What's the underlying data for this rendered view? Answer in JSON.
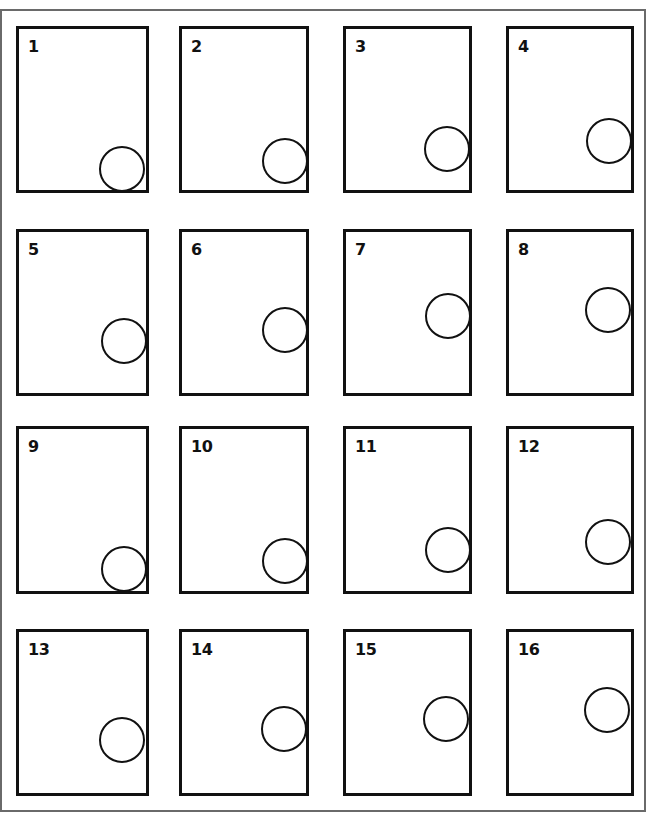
{
  "figure": {
    "grid": {
      "rows": 4,
      "columns": 4
    },
    "panels": [
      {
        "label": "1",
        "x": 16,
        "y": 26,
        "w": 133,
        "h": 167,
        "circle": {
          "cx": 122,
          "cy": 169,
          "r": 23
        }
      },
      {
        "label": "2",
        "x": 179,
        "y": 26,
        "w": 130,
        "h": 167,
        "circle": {
          "cx": 285,
          "cy": 161,
          "r": 23
        }
      },
      {
        "label": "3",
        "x": 343,
        "y": 26,
        "w": 129,
        "h": 167,
        "circle": {
          "cx": 447,
          "cy": 149,
          "r": 23
        }
      },
      {
        "label": "4",
        "x": 506,
        "y": 26,
        "w": 128,
        "h": 167,
        "circle": {
          "cx": 609,
          "cy": 141,
          "r": 23
        }
      },
      {
        "label": "5",
        "x": 16,
        "y": 229,
        "w": 133,
        "h": 167,
        "circle": {
          "cx": 124,
          "cy": 341,
          "r": 23
        }
      },
      {
        "label": "6",
        "x": 179,
        "y": 229,
        "w": 130,
        "h": 167,
        "circle": {
          "cx": 285,
          "cy": 330,
          "r": 23
        }
      },
      {
        "label": "7",
        "x": 343,
        "y": 229,
        "w": 129,
        "h": 167,
        "circle": {
          "cx": 448,
          "cy": 316,
          "r": 23
        }
      },
      {
        "label": "8",
        "x": 506,
        "y": 229,
        "w": 128,
        "h": 167,
        "circle": {
          "cx": 608,
          "cy": 310,
          "r": 23
        }
      },
      {
        "label": "9",
        "x": 16,
        "y": 426,
        "w": 133,
        "h": 168,
        "circle": {
          "cx": 124,
          "cy": 569,
          "r": 23
        }
      },
      {
        "label": "10",
        "x": 179,
        "y": 426,
        "w": 130,
        "h": 168,
        "circle": {
          "cx": 285,
          "cy": 561,
          "r": 23
        }
      },
      {
        "label": "11",
        "x": 343,
        "y": 426,
        "w": 129,
        "h": 168,
        "circle": {
          "cx": 448,
          "cy": 550,
          "r": 23
        }
      },
      {
        "label": "12",
        "x": 506,
        "y": 426,
        "w": 128,
        "h": 168,
        "circle": {
          "cx": 608,
          "cy": 542,
          "r": 23
        }
      },
      {
        "label": "13",
        "x": 16,
        "y": 629,
        "w": 133,
        "h": 167,
        "circle": {
          "cx": 122,
          "cy": 740,
          "r": 23
        }
      },
      {
        "label": "14",
        "x": 179,
        "y": 629,
        "w": 130,
        "h": 167,
        "circle": {
          "cx": 284,
          "cy": 729,
          "r": 23
        }
      },
      {
        "label": "15",
        "x": 343,
        "y": 629,
        "w": 129,
        "h": 167,
        "circle": {
          "cx": 446,
          "cy": 719,
          "r": 23
        }
      },
      {
        "label": "16",
        "x": 506,
        "y": 629,
        "w": 128,
        "h": 167,
        "circle": {
          "cx": 607,
          "cy": 710,
          "r": 23
        }
      }
    ],
    "colors": {
      "stroke": "#111111",
      "frame": "#6a6a6a",
      "background": "#ffffff"
    }
  }
}
